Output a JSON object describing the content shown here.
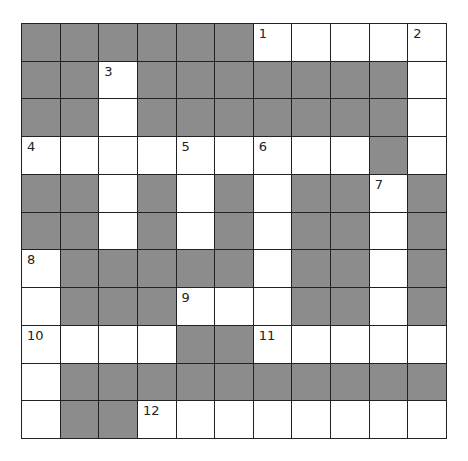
{
  "puzzle": {
    "type": "crossword",
    "rows": 11,
    "cols": 11,
    "colors": {
      "block": "#8c8c8c",
      "open": "#ffffff",
      "line": "#222222"
    },
    "layout": [
      "GGGGGGWWWWW",
      "GGWGGGGGGGW",
      "GGWGGGGGGGW",
      "WWWWWWWWWGW",
      "GGWGWGWGGWG",
      "GGWGWGWGGWG",
      "WGGGGGWGGWG",
      "WGGGWWWGGWG",
      "WWWWGGWWWWW",
      "WGGGGGGGGGG",
      "WGGWWWWWWWW"
    ],
    "numbers": [
      {
        "row": 0,
        "col": 6,
        "label": "1"
      },
      {
        "row": 0,
        "col": 10,
        "label": "2"
      },
      {
        "row": 1,
        "col": 2,
        "label": "3"
      },
      {
        "row": 3,
        "col": 0,
        "label": "4"
      },
      {
        "row": 3,
        "col": 4,
        "label": "5"
      },
      {
        "row": 3,
        "col": 6,
        "label": "6"
      },
      {
        "row": 4,
        "col": 9,
        "label": "7"
      },
      {
        "row": 6,
        "col": 0,
        "label": "8"
      },
      {
        "row": 7,
        "col": 4,
        "label": "9"
      },
      {
        "row": 8,
        "col": 0,
        "label": "10"
      },
      {
        "row": 8,
        "col": 6,
        "label": "11"
      },
      {
        "row": 10,
        "col": 3,
        "label": "12"
      }
    ]
  }
}
